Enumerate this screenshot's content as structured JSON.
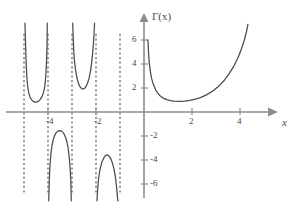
{
  "chart_data": {
    "type": "line",
    "title": "",
    "xlabel": "x",
    "ylabel": "Γ(x)",
    "function_label": "Γ(x)",
    "axis_x_label": "x",
    "grid": false,
    "legend": false,
    "xlim": [
      -5.6,
      5.3
    ],
    "ylim": [
      -7.3,
      7.6
    ],
    "xticks": [
      -4,
      -2,
      2,
      4
    ],
    "xtick_labels": [
      "-4",
      "-2",
      "2",
      "4"
    ],
    "yticks": [
      6,
      4,
      2,
      -2,
      -4,
      -6
    ],
    "ytick_labels": [
      "6",
      "4",
      "2",
      "-2",
      "-4",
      "-6"
    ],
    "asymptotes": [
      -5,
      -4,
      -3,
      -2,
      -1,
      0
    ],
    "asymptote_style": "dashed",
    "series": [
      {
        "name": "gamma-branch--5--4",
        "domain": [
          -5,
          -4
        ],
        "sign": "positive",
        "min_value": 0.8,
        "min_at": -4.5,
        "points": [
          [
            -4.96,
            7.4
          ],
          [
            -4.94,
            6.0
          ],
          [
            -4.92,
            4.6
          ],
          [
            -4.9,
            3.6
          ],
          [
            -4.87,
            2.6
          ],
          [
            -4.84,
            2.0
          ],
          [
            -4.8,
            1.6
          ],
          [
            -4.75,
            1.25
          ],
          [
            -4.7,
            1.05
          ],
          [
            -4.62,
            0.88
          ],
          [
            -4.55,
            0.82
          ],
          [
            -4.48,
            0.82
          ],
          [
            -4.4,
            0.9
          ],
          [
            -4.32,
            1.05
          ],
          [
            -4.25,
            1.28
          ],
          [
            -4.2,
            1.55
          ],
          [
            -4.15,
            1.95
          ],
          [
            -4.11,
            2.6
          ],
          [
            -4.08,
            3.4
          ],
          [
            -4.06,
            4.3
          ],
          [
            -4.04,
            5.6
          ],
          [
            -4.03,
            7.4
          ]
        ]
      },
      {
        "name": "gamma-branch--4--3",
        "domain": [
          -4,
          -3
        ],
        "sign": "negative",
        "max_value": -1.5,
        "max_at": -3.55,
        "points": [
          [
            -3.97,
            -7.4
          ],
          [
            -3.95,
            -6.0
          ],
          [
            -3.93,
            -4.9
          ],
          [
            -3.9,
            -4.0
          ],
          [
            -3.87,
            -3.3
          ],
          [
            -3.83,
            -2.75
          ],
          [
            -3.78,
            -2.3
          ],
          [
            -3.72,
            -1.95
          ],
          [
            -3.65,
            -1.7
          ],
          [
            -3.58,
            -1.57
          ],
          [
            -3.5,
            -1.55
          ],
          [
            -3.42,
            -1.62
          ],
          [
            -3.34,
            -1.8
          ],
          [
            -3.27,
            -2.1
          ],
          [
            -3.21,
            -2.5
          ],
          [
            -3.16,
            -3.0
          ],
          [
            -3.12,
            -3.7
          ],
          [
            -3.08,
            -4.6
          ],
          [
            -3.05,
            -5.7
          ],
          [
            -3.03,
            -7.4
          ]
        ]
      },
      {
        "name": "gamma-branch--3--2",
        "domain": [
          -3,
          -2
        ],
        "sign": "positive",
        "min_value": 1.9,
        "min_at": -2.6,
        "points": [
          [
            -2.97,
            7.4
          ],
          [
            -2.95,
            6.2
          ],
          [
            -2.93,
            5.2
          ],
          [
            -2.9,
            4.3
          ],
          [
            -2.86,
            3.6
          ],
          [
            -2.81,
            3.0
          ],
          [
            -2.75,
            2.5
          ],
          [
            -2.68,
            2.15
          ],
          [
            -2.6,
            1.95
          ],
          [
            -2.52,
            1.92
          ],
          [
            -2.44,
            2.05
          ],
          [
            -2.36,
            2.35
          ],
          [
            -2.29,
            2.8
          ],
          [
            -2.23,
            3.4
          ],
          [
            -2.18,
            4.1
          ],
          [
            -2.13,
            5.1
          ],
          [
            -2.09,
            6.2
          ],
          [
            -2.06,
            7.4
          ]
        ]
      },
      {
        "name": "gamma-branch--2--1",
        "domain": [
          -2,
          -1
        ],
        "sign": "negative",
        "max_value": -3.55,
        "max_at": -1.55,
        "points": [
          [
            -1.96,
            -7.4
          ],
          [
            -1.93,
            -6.4
          ],
          [
            -1.9,
            -5.7
          ],
          [
            -1.86,
            -5.1
          ],
          [
            -1.81,
            -4.6
          ],
          [
            -1.75,
            -4.15
          ],
          [
            -1.68,
            -3.85
          ],
          [
            -1.6,
            -3.62
          ],
          [
            -1.52,
            -3.58
          ],
          [
            -1.44,
            -3.7
          ],
          [
            -1.37,
            -3.95
          ],
          [
            -1.3,
            -4.35
          ],
          [
            -1.24,
            -4.85
          ],
          [
            -1.19,
            -5.45
          ],
          [
            -1.14,
            -6.3
          ],
          [
            -1.1,
            -7.2
          ],
          [
            -1.08,
            -7.4
          ]
        ]
      },
      {
        "name": "gamma-branch-0-inf",
        "domain": [
          0,
          5
        ],
        "sign": "positive",
        "min_value": 0.886,
        "min_at": 1.46,
        "points": [
          [
            0.165,
            6.0
          ],
          [
            0.18,
            5.3
          ],
          [
            0.2,
            4.6
          ],
          [
            0.22,
            4.1
          ],
          [
            0.25,
            3.6
          ],
          [
            0.28,
            3.2
          ],
          [
            0.32,
            2.78
          ],
          [
            0.37,
            2.42
          ],
          [
            0.43,
            2.12
          ],
          [
            0.5,
            1.78
          ],
          [
            0.58,
            1.55
          ],
          [
            0.68,
            1.33
          ],
          [
            0.8,
            1.16
          ],
          [
            0.95,
            1.03
          ],
          [
            1.1,
            0.95
          ],
          [
            1.25,
            0.91
          ],
          [
            1.46,
            0.886
          ],
          [
            1.7,
            0.91
          ],
          [
            1.9,
            0.96
          ],
          [
            2.1,
            1.05
          ],
          [
            2.35,
            1.2
          ],
          [
            2.6,
            1.43
          ],
          [
            2.85,
            1.73
          ],
          [
            3.1,
            2.13
          ],
          [
            3.35,
            2.65
          ],
          [
            3.55,
            3.2
          ],
          [
            3.75,
            3.85
          ],
          [
            3.92,
            4.55
          ],
          [
            4.06,
            5.25
          ],
          [
            4.18,
            6.0
          ],
          [
            4.26,
            6.6
          ],
          [
            4.33,
            7.3
          ]
        ]
      }
    ]
  },
  "axes": {
    "x_axis_label": "x",
    "y_axis_label": "Γ(x)",
    "x_tick_values": [
      "-4",
      "-2",
      "2",
      "4"
    ],
    "y_tick_values": [
      "6",
      "4",
      "2",
      "-2",
      "-4",
      "-6"
    ]
  }
}
